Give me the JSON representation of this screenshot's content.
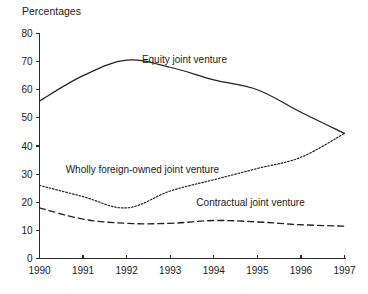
{
  "chart_data": {
    "type": "line",
    "title": "Percentages",
    "xlabel": "",
    "ylabel": "",
    "ylim": [
      0,
      80
    ],
    "ytick_step": 10,
    "yticks": [
      "0",
      "10",
      "20",
      "30",
      "40",
      "50",
      "60",
      "70",
      "80"
    ],
    "grid": false,
    "legend_position": "inline-labels",
    "categories": [
      "1990",
      "1991",
      "1992",
      "1993",
      "1994",
      "1995",
      "1996",
      "1997"
    ],
    "x": [
      1990,
      1991,
      1992,
      1993,
      1994,
      1995,
      1996,
      1997
    ],
    "series": [
      {
        "name": "Equity joint venture",
        "style": "solid",
        "color": "#222222",
        "values": [
          56,
          65,
          70.5,
          68,
          63.5,
          60,
          52,
          44.5
        ],
        "label": "Equity joint venture",
        "label_x": 1992.35,
        "label_y": 69.5
      },
      {
        "name": "Wholly foreign-owned joint venture",
        "style": "dotted",
        "color": "#222222",
        "values": [
          26,
          22,
          18,
          24,
          28,
          32,
          36,
          44.5
        ],
        "label": "Wholly foreign-owned joint venture",
        "label_x": 1990.6,
        "label_y": 30.5
      },
      {
        "name": "Contractual joint venture",
        "style": "dashed",
        "color": "#222222",
        "values": [
          18,
          14,
          12.5,
          12.5,
          13.5,
          13,
          12,
          11.5
        ],
        "label": "Contractual joint venture",
        "label_x": 1993.6,
        "label_y": 18.5
      }
    ]
  }
}
